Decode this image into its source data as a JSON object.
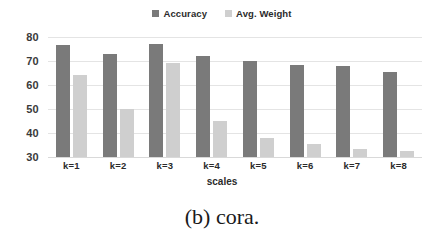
{
  "figure": {
    "caption": "(b) cora."
  },
  "legend": {
    "position": "top-center",
    "entries": [
      {
        "label": "Accuracy",
        "color": "#7a7a7a"
      },
      {
        "label": "Avg. Weight",
        "color": "#cfcfcf"
      }
    ]
  },
  "axes": {
    "y_ticks": [
      "80",
      "70",
      "60",
      "50",
      "40",
      "30"
    ],
    "x_title": "scales"
  },
  "chart_data": {
    "type": "bar",
    "title": "",
    "subtitle": "",
    "caption": "(b) cora.",
    "categories": [
      "k=1",
      "k=2",
      "k=3",
      "k=4",
      "k=5",
      "k=6",
      "k=7",
      "k=8"
    ],
    "series": [
      {
        "name": "Accuracy",
        "color": "#7a7a7a",
        "values": [
          76.5,
          73,
          77,
          72,
          70,
          68.5,
          68,
          65.5
        ]
      },
      {
        "name": "Avg. Weight",
        "color": "#cfcfcf",
        "values": [
          64,
          50,
          69,
          45,
          38,
          35.5,
          33.5,
          32.5
        ]
      }
    ],
    "xlabel": "scales",
    "ylabel": "",
    "ylim": [
      30,
      80
    ],
    "ytick_step": 10,
    "grid": true,
    "legend": "top-center"
  }
}
